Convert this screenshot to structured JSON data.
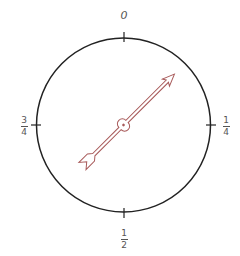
{
  "diagram": {
    "type": "spinner",
    "circle": {
      "cx": 123.5,
      "cy": 125,
      "r": 87,
      "stroke": "#222222"
    },
    "arrow": {
      "color": "#a85a5a",
      "angle_deg_from_top_clockwise": 45,
      "tip": [
        176,
        73
      ],
      "tail": [
        74,
        174
      ]
    },
    "labels": {
      "top": {
        "text": "0"
      },
      "right": {
        "numerator": "1",
        "denominator": "4"
      },
      "bottom": {
        "numerator": "1",
        "denominator": "2"
      },
      "left": {
        "numerator": "3",
        "denominator": "4"
      }
    }
  }
}
